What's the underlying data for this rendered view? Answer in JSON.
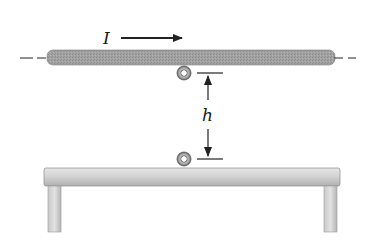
{
  "diagram": {
    "labels": {
      "current": "I",
      "height": "h"
    },
    "colors": {
      "rod": "#9c9c9c",
      "rod_edge": "#6e6e6e",
      "table_top": "#d6d6d6",
      "table_edge": "#8a8a8a",
      "arrow": "#222222",
      "background": "#ffffff"
    },
    "elements": {
      "upper_wire": {
        "label": "upper wire (rod)",
        "direction": "current to the right"
      },
      "lower_wire": {
        "label": "lower wire on table"
      },
      "table": {
        "label": "table"
      }
    }
  }
}
